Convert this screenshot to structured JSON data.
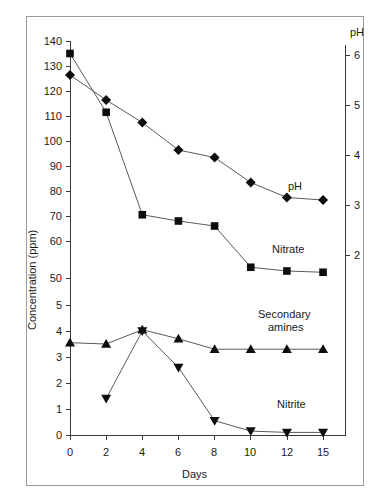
{
  "figure": {
    "background": "#ffffff",
    "border_color": "#9a9a9a"
  },
  "axes": {
    "x_title": "Days",
    "y_left_title": "Concentration (ppm)",
    "y_right_title": "pH",
    "x_ticks": [
      "0",
      "2",
      "4",
      "6",
      "8",
      "10",
      "12",
      "15"
    ],
    "y_left_ticks": [
      "140",
      "130",
      "120",
      "110",
      "100",
      "90",
      "80",
      "70",
      "60",
      "50",
      "5",
      "4",
      "3",
      "2",
      "1",
      "0"
    ],
    "y_right_ticks": [
      "6",
      "5",
      "4",
      "3",
      "2"
    ]
  },
  "series_labels": {
    "ph": "pH",
    "nitrate": "Nitrate",
    "secondary_amines": "Secondary\namines",
    "secondary_amines_line1": "Secondary",
    "secondary_amines_line2": "amines",
    "nitrite": "Nitrite"
  },
  "chart_data": {
    "type": "line",
    "title": "",
    "xlabel": "Days",
    "ylabel": "Concentration (ppm)",
    "y2label": "pH",
    "grid": false,
    "legend": "inline-annotations",
    "x": [
      0,
      2,
      4,
      6,
      8,
      10,
      12,
      15
    ],
    "xtick_labels": [
      "0",
      "2",
      "4",
      "6",
      "8",
      "10",
      "12",
      "15"
    ],
    "x_scale": "categorical-even-spacing",
    "ylim_upper_segment": [
      50,
      140
    ],
    "ylim_lower_segment": [
      0,
      5
    ],
    "y_axis_break": "between 50 and 5",
    "y2lim": [
      2,
      6
    ],
    "series": [
      {
        "name": "Nitrate",
        "marker": "filled-square",
        "axis": "left",
        "unit": "ppm",
        "values": [
          135,
          111.5,
          70.5,
          68,
          66,
          49.5,
          48,
          47.5
        ]
      },
      {
        "name": "pH",
        "marker": "filled-diamond",
        "axis": "right",
        "unit": "pH",
        "values": [
          5.6,
          5.1,
          4.65,
          4.1,
          3.95,
          3.45,
          3.15,
          3.1
        ]
      },
      {
        "name": "Secondary amines",
        "marker": "filled-triangle-up",
        "axis": "left",
        "unit": "ppm",
        "values": [
          3.55,
          3.5,
          4.05,
          3.7,
          3.3,
          3.3,
          3.3,
          3.3
        ]
      },
      {
        "name": "Nitrite",
        "marker": "filled-triangle-down",
        "axis": "left",
        "unit": "ppm",
        "values": [
          null,
          1.4,
          4.0,
          2.6,
          0.55,
          0.15,
          0.1,
          0.1
        ]
      }
    ]
  }
}
